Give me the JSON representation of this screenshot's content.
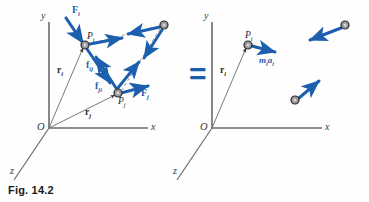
{
  "figure": {
    "caption": "Fig. 14.2",
    "equals_sign": "=",
    "accent_blue": "#1b5fae",
    "axis_gray": "#6b6b6e",
    "particle_fill": "#9a9a9d",
    "particle_stroke": "#2a2a2d"
  },
  "left_diagram": {
    "name": "system-of-particles-actual-forces",
    "axes": {
      "y": "y",
      "x": "x",
      "z": "z",
      "origin": "O"
    },
    "points": [
      {
        "id": "Pi",
        "base": "P",
        "sub": "i",
        "x": 85,
        "y": 45
      },
      {
        "id": "Pj",
        "base": "P",
        "sub": "j",
        "x": 118,
        "y": 93
      },
      {
        "id": "Pk",
        "base": "",
        "sub": "",
        "x": 164,
        "y": 25
      }
    ],
    "vectors": [
      {
        "name": "external-force-on-Pi",
        "base": "F",
        "sub": "i"
      },
      {
        "name": "external-force-on-Pj",
        "base": "F",
        "sub": "j"
      },
      {
        "name": "internal-force-ij",
        "base": "f",
        "sub": "ij"
      },
      {
        "name": "internal-force-ji",
        "base": "f",
        "sub": "ji"
      },
      {
        "name": "position-vector-i",
        "base": "r",
        "sub": "i"
      },
      {
        "name": "position-vector-j",
        "base": "r",
        "sub": "j"
      }
    ]
  },
  "right_diagram": {
    "name": "system-of-particles-effective-forces",
    "axes": {
      "y": "y",
      "x": "x",
      "z": "z",
      "origin": "O"
    },
    "points": [
      {
        "id": "Pi",
        "base": "P",
        "sub": "i",
        "x": 248,
        "y": 45
      },
      {
        "id": "Pk",
        "base": "",
        "sub": "",
        "x": 345,
        "y": 25
      },
      {
        "id": "Pm",
        "base": "",
        "sub": "",
        "x": 295,
        "y": 100
      }
    ],
    "vectors": [
      {
        "name": "effective-force-on-Pi",
        "m": "m",
        "msub": "i",
        "a": "a",
        "asub": "i"
      },
      {
        "name": "position-vector-i",
        "base": "r",
        "sub": "i"
      }
    ]
  }
}
